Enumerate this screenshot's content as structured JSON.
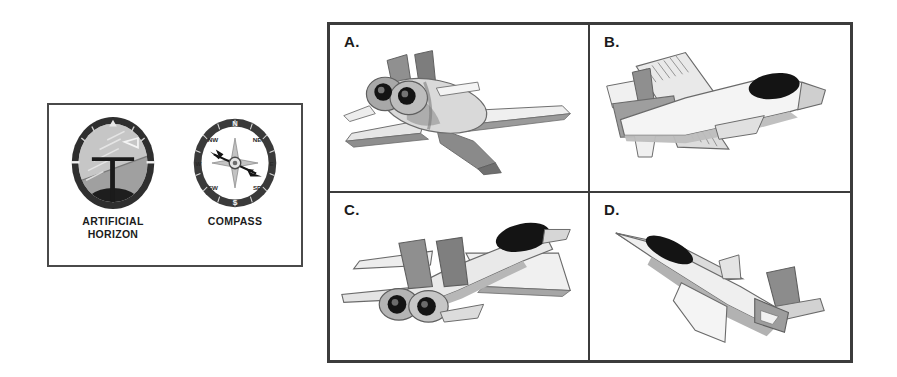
{
  "instrument_panel": {
    "instruments": [
      {
        "id": "artificial-horizon",
        "caption_line1": "ARTIFICIAL",
        "caption_line2": "HORIZON",
        "bezel_color": "#2f2f2f",
        "sky_color": "#b9b9b9",
        "ground_color": "#1e1e1e",
        "pointer_color": "#f0f0f0"
      },
      {
        "id": "compass",
        "caption_line1": "COMPASS",
        "caption_line2": "",
        "bezel_color": "#3a3a3a",
        "face_color": "#ffffff",
        "needle_color": "#1a1a1a",
        "cardinal_points": [
          "N",
          "E",
          "S",
          "W"
        ],
        "ordinal_points": [
          "NE",
          "SE",
          "SW",
          "NW"
        ]
      }
    ]
  },
  "aircraft_grid": {
    "cells": [
      {
        "id": "A",
        "label": "A.",
        "description": "jet seen from rear three-quarter, twin dark engine nozzles, twin tails"
      },
      {
        "id": "B",
        "label": "B.",
        "description": "jet seen from front three-quarter below, dark canopy, nose to the right"
      },
      {
        "id": "C",
        "label": "C.",
        "description": "jet seen from rear three-quarter above, twin nozzles and dark canopy"
      },
      {
        "id": "D",
        "label": "D.",
        "description": "slender jet climbing up-left, dark canopy, swept tail"
      }
    ]
  },
  "colors": {
    "border": "#3c3c3c",
    "panel_border": "#4a4a4a",
    "background": "#ffffff",
    "ink": "#1b1b1b",
    "plane_light": "#f2f2f2",
    "plane_mid": "#c9c9c9",
    "plane_dark": "#8e8e8e",
    "plane_darker": "#6d6d6d",
    "plane_black": "#141414"
  }
}
